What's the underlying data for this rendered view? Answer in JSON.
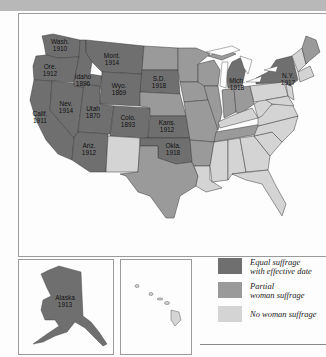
{
  "colors": {
    "equal": "#6f6f6f",
    "partial": "#9a9a9a",
    "none": "#d4d4d4",
    "border": "#3a3a3a"
  },
  "map": {
    "states_labeled": [
      {
        "abbr": "Wash.",
        "year": "1910"
      },
      {
        "abbr": "Ore.",
        "year": "1912"
      },
      {
        "abbr": "Calif.",
        "year": "1911"
      },
      {
        "abbr": "Idaho",
        "year": "1896"
      },
      {
        "abbr": "Nev.",
        "year": "1914"
      },
      {
        "abbr": "Utah",
        "year": "1870"
      },
      {
        "abbr": "Ariz.",
        "year": "1912"
      },
      {
        "abbr": "Mont.",
        "year": "1914"
      },
      {
        "abbr": "Wyo.",
        "year": "1869"
      },
      {
        "abbr": "Colo.",
        "year": "1893"
      },
      {
        "abbr": "S.D.",
        "year": "1918"
      },
      {
        "abbr": "Kans.",
        "year": "1912"
      },
      {
        "abbr": "Okla.",
        "year": "1918"
      },
      {
        "abbr": "Mich.",
        "year": "1918"
      },
      {
        "abbr": "N.Y.",
        "year": "1917"
      },
      {
        "abbr": "Alaska",
        "year": "1913"
      }
    ]
  },
  "legend": {
    "items": [
      {
        "line1": "Equal suffrage",
        "line2": "with effective date",
        "key": "equal"
      },
      {
        "line1": "Partial",
        "line2": "woman suffrage",
        "key": "partial"
      },
      {
        "line1": "No woman suffrage",
        "line2": "",
        "key": "none"
      }
    ]
  }
}
